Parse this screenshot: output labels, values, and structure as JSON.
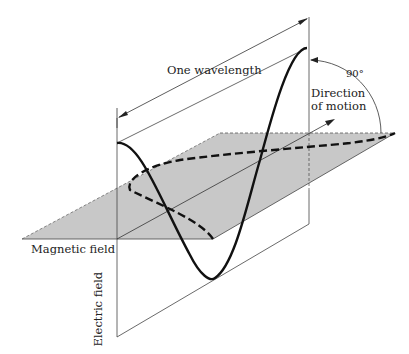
{
  "diagram": {
    "type": "electromagnetic-wave",
    "labels": {
      "wavelength": "One wavelength",
      "angle": "90°",
      "direction_line1": "Direction",
      "direction_line2": "of motion",
      "magnetic": "Magnetic field",
      "electric": "Electric field"
    },
    "colors": {
      "plane_fill": "#c8c8c8",
      "line": "#222222",
      "background": "#ffffff"
    }
  }
}
